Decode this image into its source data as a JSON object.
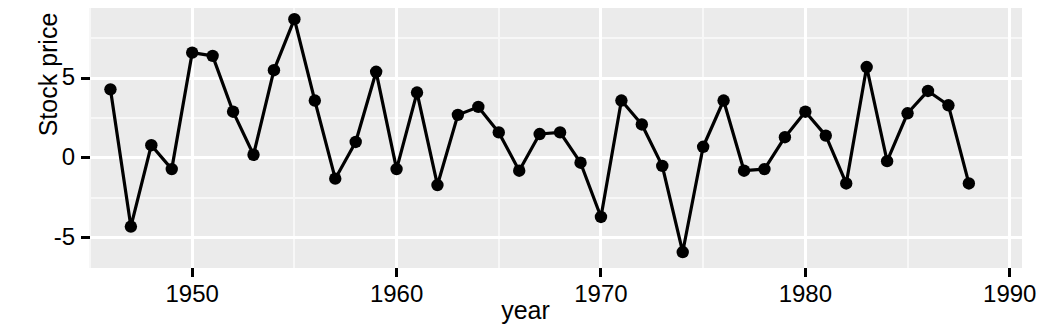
{
  "chart_data": {
    "type": "line",
    "title": "",
    "xlabel": "year",
    "ylabel": "Stock price",
    "grid": true,
    "legend": false,
    "xlim": [
      1945.0,
      1990.6
    ],
    "ylim": [
      -6.9,
      9.4
    ],
    "x_ticks": [
      1950,
      1960,
      1970,
      1980,
      1990
    ],
    "x_tick_labels": [
      "1950",
      "1960",
      "1970",
      "1980",
      "1990"
    ],
    "y_ticks": [
      -5,
      0,
      5
    ],
    "y_tick_labels": [
      "-5",
      "0",
      "5"
    ],
    "marker": "filled-circle",
    "marker_color": "#000000",
    "line_color": "#000000",
    "panel_color": "#ebebeb",
    "grid_color": "#ffffff",
    "x": [
      1946,
      1947,
      1948,
      1949,
      1950,
      1951,
      1952,
      1953,
      1954,
      1955,
      1956,
      1957,
      1958,
      1959,
      1960,
      1961,
      1962,
      1963,
      1964,
      1965,
      1966,
      1967,
      1968,
      1969,
      1970,
      1971,
      1972,
      1973,
      1974,
      1975,
      1976,
      1977,
      1978,
      1979,
      1980,
      1981,
      1982,
      1983,
      1984,
      1985,
      1986,
      1987,
      1988
    ],
    "values": [
      4.3,
      -4.3,
      0.8,
      -0.7,
      6.6,
      6.4,
      2.9,
      0.2,
      5.5,
      8.7,
      3.6,
      -1.3,
      1.0,
      5.4,
      -0.7,
      4.1,
      -1.7,
      2.7,
      3.2,
      1.6,
      -0.8,
      1.5,
      1.6,
      -0.3,
      -3.7,
      3.6,
      2.1,
      -0.5,
      -5.9,
      0.7,
      3.6,
      -0.8,
      -0.7,
      1.3,
      2.9,
      1.4,
      -1.6,
      5.7,
      -0.2,
      2.8,
      4.2,
      3.3,
      -1.6
    ],
    "series_name": "Stock price"
  },
  "axis": {
    "y_title": "Stock price",
    "x_title": "year"
  }
}
